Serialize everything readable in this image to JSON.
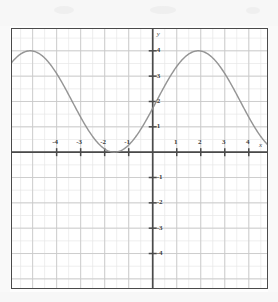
{
  "chart_data": {
    "type": "line",
    "title": "",
    "subtitle": "",
    "xlabel": "x",
    "ylabel": "y",
    "xlim": [
      -5.9,
      4.8
    ],
    "ylim": [
      -5.4,
      4.9
    ],
    "xticks": [
      -4,
      -3,
      -2,
      -1,
      1,
      2,
      3,
      4
    ],
    "xticklabels": [
      "-4",
      "-3",
      "-2",
      "-1",
      "1",
      "2",
      "3",
      "4"
    ],
    "yticks": [
      4,
      3,
      2,
      1,
      -1,
      -2,
      -3,
      -4
    ],
    "yticklabels": [
      "4",
      "3",
      "2",
      "1",
      "-1",
      "-2",
      "-3",
      "-4"
    ],
    "grid": true,
    "grid_minor_step": 0.5,
    "grid_major_step": 1,
    "legend": "none",
    "series": [
      {
        "name": "curve",
        "equation_form": "y = 2*cos((2*pi/7)*(x - 1.9)) + 2",
        "amplitude": 2,
        "midline": 2,
        "period": 7,
        "phase_shift": 1.9,
        "y_intercept": 2,
        "maxima_x": [
          -5.1,
          1.9
        ],
        "maxima_y": 4,
        "minima_x": [
          -1.6,
          5.4
        ],
        "minima_y": 0,
        "x": [
          -5.9,
          -5.6,
          -5.3,
          -5.1,
          -4.8,
          -4.5,
          -4.2,
          -3.9,
          -3.6,
          -3.3,
          -3.0,
          -2.7,
          -2.4,
          -2.1,
          -1.8,
          -1.6,
          -1.3,
          -1.0,
          -0.7,
          -0.4,
          -0.1,
          0.0,
          0.3,
          0.6,
          0.9,
          1.2,
          1.5,
          1.9,
          2.2,
          2.5,
          2.8,
          3.1,
          3.4,
          3.7,
          4.0,
          4.3,
          4.6,
          4.8
        ],
        "y": [
          3.74,
          3.91,
          3.99,
          4.0,
          3.94,
          3.79,
          3.57,
          3.28,
          2.95,
          2.57,
          2.18,
          1.79,
          1.41,
          1.06,
          0.76,
          0.6,
          0.38,
          0.21,
          0.1,
          0.03,
          0.0,
          0.0,
          0.05,
          0.16,
          0.34,
          0.57,
          0.86,
          1.35,
          1.73,
          2.12,
          2.5,
          2.86,
          3.19,
          3.48,
          3.71,
          3.88,
          3.97,
          4.0
        ]
      }
    ]
  },
  "axes": {
    "y_axis_label": "y",
    "x_axis_label": "x"
  },
  "colors": {
    "curve": "#8d8d8d",
    "axis": "#4a4a4a",
    "grid_major": "#c9c9c9",
    "grid_minor": "#e6e6e6",
    "frame": "#4a4a4a",
    "tick_label": "#3a3a3a",
    "background": "#ffffff"
  }
}
